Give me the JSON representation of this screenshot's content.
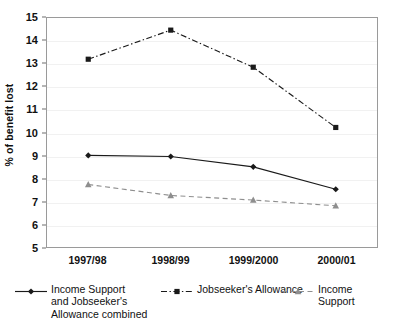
{
  "chart_data": {
    "type": "line",
    "title": "",
    "xlabel": "",
    "ylabel": "% of benefit lost",
    "categories": [
      "1997/98",
      "1998/99",
      "1999/2000",
      "2000/01"
    ],
    "ylim": [
      5,
      15
    ],
    "yticks": [
      5,
      6,
      7,
      8,
      9,
      10,
      11,
      12,
      13,
      14,
      15
    ],
    "ytick_labels": [
      "5",
      "6",
      "7",
      "8",
      "9",
      "10",
      "11",
      "12",
      "13",
      "14",
      "15"
    ],
    "grid": true,
    "legend_position": "bottom-left",
    "series": [
      {
        "name": "Income Support and Jobseeker's Allowance combined",
        "legend_label": "Income Support\nand Jobseeker's\nAllowance combined",
        "values": [
          9.0,
          8.95,
          8.5,
          7.52
        ],
        "marker": "diamond",
        "line_style": "solid",
        "color": "#1a1a1a"
      },
      {
        "name": "Jobseeker's Allowance",
        "legend_label": "Jobseeker's Allowance",
        "values": [
          13.2,
          14.47,
          12.85,
          10.22
        ],
        "marker": "square",
        "line_style": "dash-dot",
        "color": "#1a1a1a"
      },
      {
        "name": "Income Support",
        "legend_label": "Income Support",
        "values": [
          7.73,
          7.25,
          7.05,
          6.8
        ],
        "marker": "triangle",
        "line_style": "dashed",
        "color": "#8e8e8e"
      }
    ]
  }
}
